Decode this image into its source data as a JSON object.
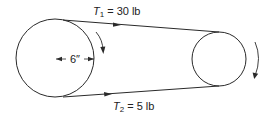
{
  "diagram": {
    "type": "belt-drive",
    "tensions": {
      "top": {
        "symbol": "T",
        "subscript": "1",
        "equals": "=",
        "value": "30 lb"
      },
      "bottom": {
        "symbol": "T",
        "subscript": "2",
        "equals": "=",
        "value": "5 lb"
      }
    },
    "dimension": {
      "label": "6″",
      "refers_to": "radius of large pulley"
    },
    "pulleys": [
      {
        "name": "large-pulley",
        "rotation": "clockwise"
      },
      {
        "name": "small-pulley",
        "rotation": "clockwise"
      }
    ],
    "colors": {
      "stroke": "#2a2a2a",
      "background": "#ffffff"
    }
  }
}
